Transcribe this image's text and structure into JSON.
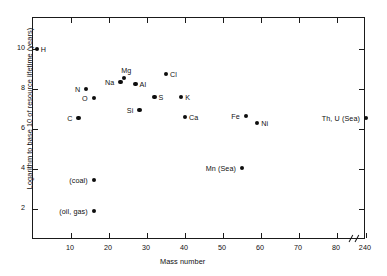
{
  "chart_data": {
    "type": "scatter",
    "title": "",
    "xlabel": "Mass number",
    "ylabel": "Logarithm to base 10 of resource lifetime (years)",
    "xlim": [
      0,
      87
    ],
    "ylim": [
      0,
      11.1
    ],
    "xticks": [
      10,
      20,
      30,
      40,
      50,
      60,
      70,
      80,
      240
    ],
    "yticks": [
      2,
      4,
      6,
      8,
      10
    ],
    "grid": false,
    "legend": null,
    "axis_break": {
      "present": true,
      "after_tick": 80,
      "resumes_at": 240
    },
    "points": [
      {
        "label": "H",
        "x": 1,
        "y": 10.0,
        "label_side": "right"
      },
      {
        "label": "C",
        "x": 12,
        "y": 6.55,
        "label_side": "left"
      },
      {
        "label": "N",
        "x": 14,
        "y": 8.0,
        "label_side": "left"
      },
      {
        "label": "O",
        "x": 16,
        "y": 7.55,
        "label_side": "left"
      },
      {
        "label": "(coal)",
        "x": 16,
        "y": 3.45,
        "label_side": "left"
      },
      {
        "label": "(oil, gas)",
        "x": 16,
        "y": 1.9,
        "label_side": "left"
      },
      {
        "label": "Na",
        "x": 23,
        "y": 8.35,
        "label_side": "left"
      },
      {
        "label": "Mg",
        "x": 24,
        "y": 8.55,
        "label_side": "above"
      },
      {
        "label": "Al",
        "x": 27,
        "y": 8.25,
        "label_side": "right"
      },
      {
        "label": "Si",
        "x": 28,
        "y": 6.95,
        "label_side": "left"
      },
      {
        "label": "S",
        "x": 32,
        "y": 7.6,
        "label_side": "right"
      },
      {
        "label": "Cl",
        "x": 35,
        "y": 8.75,
        "label_side": "right"
      },
      {
        "label": "K",
        "x": 39,
        "y": 7.6,
        "label_side": "right"
      },
      {
        "label": "Ca",
        "x": 40,
        "y": 6.6,
        "label_side": "right"
      },
      {
        "label": "Mn (Sea)",
        "x": 55,
        "y": 4.05,
        "label_side": "left"
      },
      {
        "label": "Fe",
        "x": 56,
        "y": 6.65,
        "label_side": "left"
      },
      {
        "label": "Ni",
        "x": 59,
        "y": 6.3,
        "label_side": "right"
      },
      {
        "label": "Th, U (Sea)",
        "x": 240,
        "y": 6.55,
        "label_side": "left"
      }
    ]
  }
}
